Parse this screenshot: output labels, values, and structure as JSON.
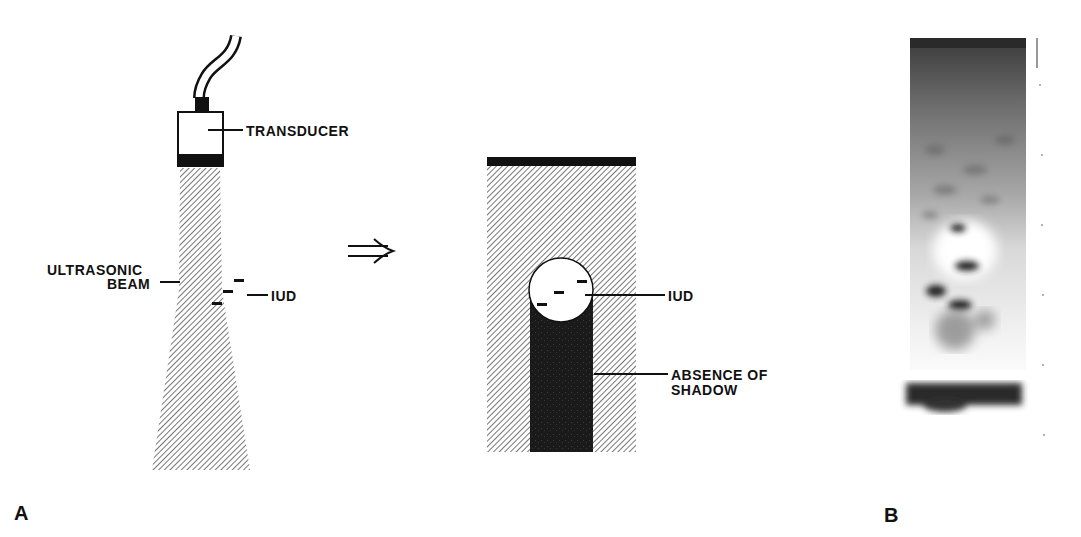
{
  "figure": {
    "panel_a": {
      "letter": "A",
      "labels": {
        "transducer": "TRANSDUCER",
        "ultrasonic_beam_line1": "ULTRASONIC",
        "ultrasonic_beam_line2": "BEAM",
        "iud_left": "IUD",
        "iud_right": "IUD",
        "absence_line1": "ABSENCE OF",
        "absence_line2": "SHADOW"
      },
      "arrow_glyph": "⇒"
    },
    "panel_b": {
      "letter": "B"
    }
  }
}
